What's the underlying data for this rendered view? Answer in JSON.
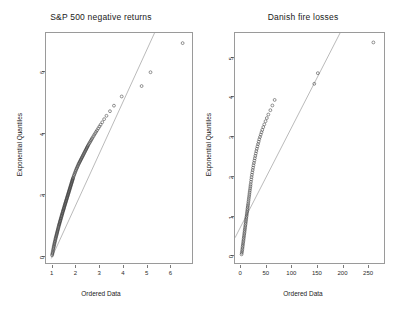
{
  "figure": {
    "background": "#ffffff",
    "point_color": "#3b3b3b",
    "line_color": "#8a8a8a",
    "frame_color": "#9a9a9a"
  },
  "chart_data": [
    {
      "type": "scatter",
      "title": "S&P 500 negative returns",
      "xlabel": "Ordered Data",
      "ylabel": "Exponential Quantiles",
      "xlim": [
        0.72,
        6.95
      ],
      "ylim": [
        -0.25,
        7.25
      ],
      "xticks": [
        1,
        2,
        3,
        4,
        5,
        6
      ],
      "yticks": [
        0,
        2,
        4,
        6
      ],
      "grid": false,
      "legend": "none",
      "reference_line": {
        "x1": 0.95,
        "y1": -0.1,
        "x2": 5.35,
        "y2": 7.25
      },
      "points_x": [
        0.98,
        0.99,
        1.0,
        1.01,
        1.02,
        1.03,
        1.04,
        1.05,
        1.06,
        1.07,
        1.08,
        1.09,
        1.1,
        1.11,
        1.12,
        1.13,
        1.14,
        1.15,
        1.16,
        1.17,
        1.18,
        1.19,
        1.2,
        1.21,
        1.22,
        1.23,
        1.24,
        1.25,
        1.26,
        1.27,
        1.28,
        1.29,
        1.3,
        1.31,
        1.32,
        1.33,
        1.34,
        1.35,
        1.36,
        1.37,
        1.38,
        1.39,
        1.4,
        1.41,
        1.42,
        1.43,
        1.44,
        1.45,
        1.46,
        1.47,
        1.48,
        1.49,
        1.5,
        1.51,
        1.52,
        1.53,
        1.54,
        1.55,
        1.56,
        1.57,
        1.58,
        1.59,
        1.6,
        1.61,
        1.62,
        1.63,
        1.64,
        1.65,
        1.66,
        1.67,
        1.68,
        1.69,
        1.7,
        1.71,
        1.72,
        1.73,
        1.74,
        1.75,
        1.76,
        1.77,
        1.78,
        1.79,
        1.8,
        1.81,
        1.82,
        1.83,
        1.84,
        1.85,
        1.86,
        1.87,
        1.88,
        1.9,
        1.92,
        1.94,
        1.96,
        1.98,
        2.0,
        2.02,
        2.04,
        2.06,
        2.08,
        2.1,
        2.12,
        2.14,
        2.16,
        2.18,
        2.2,
        2.22,
        2.24,
        2.26,
        2.28,
        2.3,
        2.32,
        2.34,
        2.36,
        2.38,
        2.4,
        2.42,
        2.44,
        2.46,
        2.48,
        2.5,
        2.52,
        2.55,
        2.58,
        2.61,
        2.64,
        2.67,
        2.7,
        2.74,
        2.78,
        2.82,
        2.86,
        2.9,
        2.95,
        3.0,
        3.05,
        3.12,
        3.2,
        3.3,
        3.45,
        3.62,
        3.95,
        4.8,
        5.18,
        6.55
      ],
      "points_y": [
        0.0,
        0.04,
        0.08,
        0.12,
        0.16,
        0.2,
        0.24,
        0.28,
        0.31,
        0.35,
        0.38,
        0.42,
        0.45,
        0.48,
        0.52,
        0.55,
        0.58,
        0.61,
        0.64,
        0.67,
        0.7,
        0.73,
        0.76,
        0.79,
        0.82,
        0.85,
        0.88,
        0.91,
        0.94,
        0.97,
        1.0,
        1.02,
        1.05,
        1.08,
        1.11,
        1.13,
        1.16,
        1.19,
        1.21,
        1.24,
        1.27,
        1.29,
        1.32,
        1.35,
        1.37,
        1.4,
        1.43,
        1.45,
        1.48,
        1.5,
        1.53,
        1.55,
        1.58,
        1.61,
        1.63,
        1.66,
        1.68,
        1.71,
        1.73,
        1.76,
        1.78,
        1.81,
        1.83,
        1.86,
        1.88,
        1.91,
        1.93,
        1.96,
        1.98,
        2.01,
        2.03,
        2.06,
        2.08,
        2.11,
        2.13,
        2.16,
        2.18,
        2.21,
        2.23,
        2.26,
        2.28,
        2.31,
        2.33,
        2.36,
        2.38,
        2.41,
        2.43,
        2.46,
        2.48,
        2.51,
        2.53,
        2.58,
        2.62,
        2.66,
        2.7,
        2.74,
        2.78,
        2.82,
        2.85,
        2.89,
        2.92,
        2.96,
        2.99,
        3.02,
        3.05,
        3.08,
        3.11,
        3.14,
        3.17,
        3.2,
        3.23,
        3.26,
        3.29,
        3.32,
        3.35,
        3.38,
        3.41,
        3.44,
        3.47,
        3.5,
        3.53,
        3.56,
        3.59,
        3.63,
        3.67,
        3.71,
        3.75,
        3.79,
        3.83,
        3.88,
        3.93,
        3.98,
        4.03,
        4.08,
        4.14,
        4.2,
        4.26,
        4.34,
        4.44,
        4.55,
        4.7,
        4.88,
        5.18,
        5.52,
        5.97,
        6.92
      ]
    },
    {
      "type": "scatter",
      "title": "Danish fire losses",
      "xlabel": "Ordered Data",
      "ylabel": "Exponential Quantiles",
      "xlim": [
        -12,
        283
      ],
      "ylim": [
        -0.22,
        5.62
      ],
      "xticks": [
        0,
        50,
        100,
        150,
        200,
        250
      ],
      "yticks": [
        0,
        1,
        2,
        3,
        4,
        5
      ],
      "grid": false,
      "legend": "none",
      "reference_line": {
        "x1": -12,
        "y1": 0.42,
        "x2": 196,
        "y2": 5.62
      },
      "points_x": [
        1.0,
        1.5,
        2.0,
        2.4,
        2.8,
        3.2,
        3.6,
        4.0,
        4.4,
        4.8,
        5.2,
        5.6,
        6.0,
        6.4,
        6.8,
        7.2,
        7.6,
        8.0,
        8.4,
        8.8,
        9.2,
        9.6,
        10.0,
        10.4,
        10.8,
        11.2,
        11.6,
        12.0,
        12.4,
        12.8,
        13.2,
        13.6,
        14.0,
        14.5,
        15.0,
        15.5,
        16.0,
        16.5,
        17.0,
        17.5,
        18.0,
        18.5,
        19.0,
        19.6,
        20.2,
        20.8,
        21.5,
        22.2,
        23.0,
        23.8,
        24.6,
        25.5,
        26.4,
        27.3,
        28.2,
        29.2,
        30.2,
        31.2,
        32.4,
        33.6,
        34.8,
        36.0,
        37.5,
        39.0,
        40.5,
        42.0,
        44.0,
        46.0,
        48.5,
        51.0,
        54.0,
        58.0,
        62.0,
        66.5,
        145.0,
        152.0,
        262.0
      ],
      "points_y": [
        0.0,
        0.04,
        0.08,
        0.12,
        0.16,
        0.2,
        0.24,
        0.28,
        0.32,
        0.36,
        0.4,
        0.44,
        0.48,
        0.52,
        0.56,
        0.6,
        0.64,
        0.68,
        0.72,
        0.76,
        0.8,
        0.84,
        0.88,
        0.92,
        0.96,
        1.0,
        1.04,
        1.08,
        1.12,
        1.16,
        1.2,
        1.24,
        1.28,
        1.33,
        1.38,
        1.43,
        1.48,
        1.53,
        1.58,
        1.63,
        1.68,
        1.73,
        1.78,
        1.84,
        1.9,
        1.96,
        2.02,
        2.08,
        2.14,
        2.2,
        2.26,
        2.32,
        2.38,
        2.44,
        2.5,
        2.56,
        2.62,
        2.68,
        2.74,
        2.8,
        2.86,
        2.92,
        2.98,
        3.04,
        3.1,
        3.16,
        3.23,
        3.3,
        3.38,
        3.46,
        3.55,
        3.66,
        3.78,
        3.92,
        4.33,
        4.6,
        5.38
      ]
    }
  ]
}
